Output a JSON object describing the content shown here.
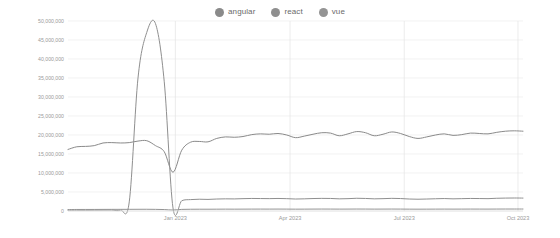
{
  "legend": {
    "position": "top-center",
    "items": [
      {
        "label": "angular",
        "color": "#8a8a8a",
        "icon": "circle-marker-icon"
      },
      {
        "label": "react",
        "color": "#8f8f8f",
        "icon": "circle-marker-icon"
      },
      {
        "label": "vue",
        "color": "#949494",
        "icon": "circle-marker-icon"
      }
    ]
  },
  "axes": {
    "y_ticks": [
      "0",
      "5,000,000",
      "10,000,000",
      "15,000,000",
      "20,000,000",
      "25,000,000",
      "30,000,000",
      "35,000,000",
      "40,000,000",
      "45,000,000",
      "50,000,000"
    ],
    "x_ticks": [
      "Jan 2023",
      "Apr 2023",
      "Jul 2023",
      "Oct 2023"
    ]
  },
  "colors": {
    "angular": "#8a8a8a",
    "react": "#8f8f8f",
    "vue": "#949494",
    "grid": "#ececec",
    "vgrid": "#e4e4e4",
    "axis": "#d8d8d8",
    "tick_text": "#9a9a9a",
    "legend_text": "#6a6a6a",
    "background": "#ffffff"
  },
  "chart_data": {
    "type": "line",
    "title": "",
    "subtitle": "",
    "xlabel": "",
    "ylabel": "",
    "ylim": [
      0,
      50000000
    ],
    "ytick_values": [
      0,
      5000000,
      10000000,
      15000000,
      20000000,
      25000000,
      30000000,
      35000000,
      40000000,
      45000000,
      50000000
    ],
    "grid": true,
    "legend_position": "top-center",
    "x_tick_labels": [
      "Jan 2023",
      "Apr 2023",
      "Jul 2023",
      "Oct 2023"
    ],
    "x_tick_fractions": [
      0.236,
      0.488,
      0.739,
      0.989
    ],
    "x": [
      "2022-10-09",
      "2022-10-16",
      "2022-10-23",
      "2022-10-30",
      "2022-11-06",
      "2022-11-13",
      "2022-11-20",
      "2022-11-27",
      "2022-12-04",
      "2022-12-11",
      "2022-12-18",
      "2022-12-25",
      "2023-01-01",
      "2023-01-08",
      "2023-01-15",
      "2023-01-22",
      "2023-01-29",
      "2023-02-05",
      "2023-02-12",
      "2023-02-19",
      "2023-02-26",
      "2023-03-05",
      "2023-03-12",
      "2023-03-19",
      "2023-03-26",
      "2023-04-02",
      "2023-04-09",
      "2023-04-16",
      "2023-04-23",
      "2023-04-30",
      "2023-05-07",
      "2023-05-14",
      "2023-05-21",
      "2023-05-28",
      "2023-06-04",
      "2023-06-11",
      "2023-06-18",
      "2023-06-25",
      "2023-07-02",
      "2023-07-09",
      "2023-07-16",
      "2023-07-23",
      "2023-07-30",
      "2023-08-06",
      "2023-08-13",
      "2023-08-20",
      "2023-08-27",
      "2023-09-03",
      "2023-09-10",
      "2023-09-17",
      "2023-09-24",
      "2023-10-01",
      "2023-10-08"
    ],
    "series": [
      {
        "name": "angular",
        "color": "#8a8a8a",
        "values": [
          16200000,
          16900000,
          17000000,
          17200000,
          17900000,
          18000000,
          17900000,
          18000000,
          18400000,
          18500000,
          17200000,
          15600000,
          10200000,
          16000000,
          18100000,
          18300000,
          18200000,
          19100000,
          19500000,
          19400000,
          19600000,
          20100000,
          20300000,
          20200000,
          20400000,
          20000000,
          19300000,
          19700000,
          20200000,
          20600000,
          20500000,
          19800000,
          20300000,
          20900000,
          20600000,
          19800000,
          20200000,
          20800000,
          20400000,
          19600000,
          19100000,
          19500000,
          20000000,
          20300000,
          19900000,
          20100000,
          20500000,
          20400000,
          20300000,
          20700000,
          21000000,
          21100000,
          21000000
        ]
      },
      {
        "name": "react",
        "color": "#8f8f8f",
        "values": [
          200000,
          220000,
          210000,
          230000,
          240000,
          250000,
          260000,
          2400000,
          35000000,
          47000000,
          49300000,
          34000000,
          800000,
          2700000,
          3000000,
          3100000,
          3050000,
          3150000,
          3200000,
          3180000,
          3250000,
          3300000,
          3280000,
          3260000,
          3300000,
          3250000,
          3150000,
          3200000,
          3280000,
          3320000,
          3300000,
          3200000,
          3250000,
          3350000,
          3300000,
          3200000,
          3250000,
          3330000,
          3280000,
          3150000,
          3100000,
          3150000,
          3220000,
          3280000,
          3200000,
          3250000,
          3300000,
          3280000,
          3250000,
          3350000,
          3400000,
          3420000,
          3400000
        ]
      },
      {
        "name": "vue",
        "color": "#949494",
        "values": [
          380000,
          400000,
          405000,
          410000,
          420000,
          430000,
          435000,
          440000,
          450000,
          455000,
          430000,
          380000,
          260000,
          420000,
          460000,
          470000,
          468000,
          480000,
          490000,
          485000,
          492000,
          500000,
          505000,
          500000,
          508000,
          500000,
          485000,
          492000,
          505000,
          512000,
          508000,
          495000,
          502000,
          515000,
          510000,
          495000,
          503000,
          513000,
          505000,
          488000,
          480000,
          488000,
          498000,
          505000,
          495000,
          500000,
          508000,
          505000,
          500000,
          512000,
          520000,
          522000,
          520000
        ]
      }
    ]
  }
}
